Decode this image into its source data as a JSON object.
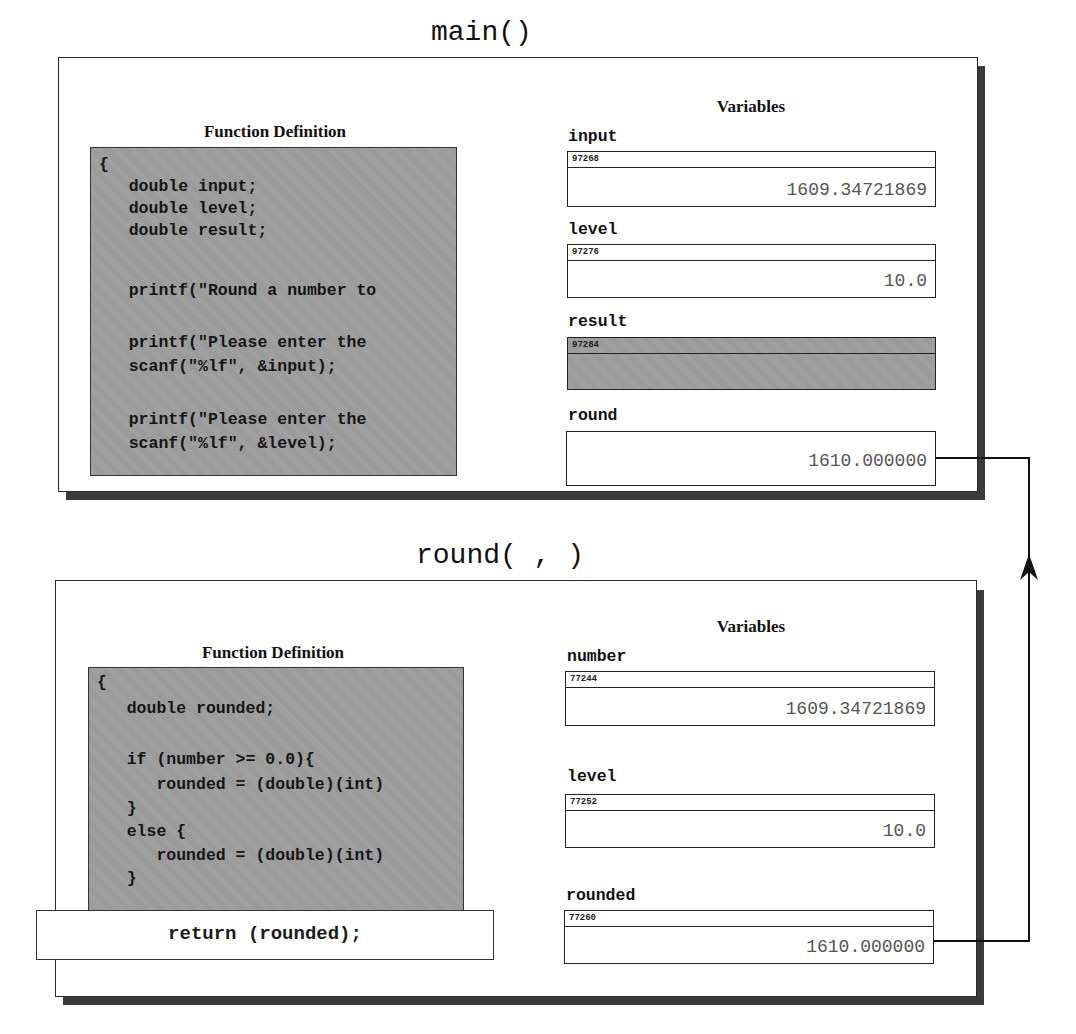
{
  "main_frame": {
    "title": "main()",
    "function_definition_heading": "Function Definition",
    "variables_heading": "Variables",
    "code_lines": [
      "{",
      "   double input;",
      "   double level;",
      "   double result;",
      "",
      "   printf(\"Round a number to",
      "",
      "   printf(\"Please enter the",
      "   scanf(\"%lf\", &input);",
      "",
      "   printf(\"Please enter the",
      "   scanf(\"%lf\", &level);"
    ],
    "variables": [
      {
        "name": "input",
        "address": "97268",
        "value": "1609.34721869",
        "shaded": false
      },
      {
        "name": "level",
        "address": "97276",
        "value": "10.0",
        "shaded": false
      },
      {
        "name": "result",
        "address": "97284",
        "value": "",
        "shaded": true
      },
      {
        "name": "round",
        "address": "",
        "value": "1610.000000",
        "shaded": false
      }
    ]
  },
  "round_frame": {
    "title": "round( , )",
    "function_definition_heading": "Function Definition",
    "variables_heading": "Variables",
    "code_lines": [
      "{",
      "   double rounded;",
      "",
      "   if (number >= 0.0){",
      "      rounded = (double)(int)",
      "   }",
      "   else {",
      "      rounded = (double)(int)",
      "   }"
    ],
    "return_statement": "return (rounded);",
    "variables": [
      {
        "name": "number",
        "address": "77244",
        "value": "1609.34721869",
        "shaded": false
      },
      {
        "name": "level",
        "address": "77252",
        "value": "10.0",
        "shaded": false
      },
      {
        "name": "rounded",
        "address": "77260",
        "value": "1610.000000",
        "shaded": false
      }
    ]
  },
  "connector": {
    "description": "return value flows from round() 'rounded' to main() 'round'",
    "arrow_icon": "arrow-up-icon"
  },
  "colors": {
    "frame_border": "#2a2a2a",
    "shadow": "#3a3a3a",
    "code_background": "#9d9d9d",
    "value_text": "#555555"
  }
}
